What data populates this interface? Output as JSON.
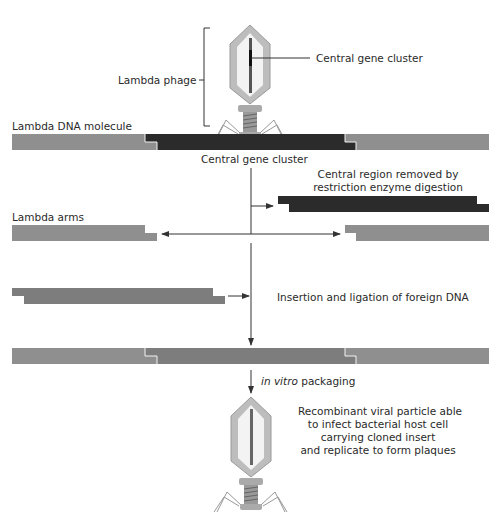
{
  "labels": {
    "lambda_phage": "Lambda phage",
    "central_gene_cluster_top": "Central gene cluster",
    "lambda_dna_molecule": "Lambda DNA molecule",
    "central_gene_cluster_mid": "Central gene cluster",
    "central_region_removed_1": "Central region removed by",
    "central_region_removed_2": "restriction enzyme digestion",
    "lambda_arms": "Lambda arms",
    "insertion": "Insertion and ligation of foreign DNA",
    "in_vitro": "in vitro",
    "packaging": " packaging",
    "recombinant_1": "Recombinant viral particle able",
    "recombinant_2": "to infect bacterial host cell",
    "recombinant_3": "carrying cloned insert",
    "recombinant_4": "and replicate to form plaques"
  },
  "colors": {
    "arm_gray": "#8f8f8f",
    "central_dark": "#2b2b2b",
    "foreign_dna": "#7d7d7d",
    "line": "#333333",
    "phage_fill": "#bdbdbd"
  }
}
